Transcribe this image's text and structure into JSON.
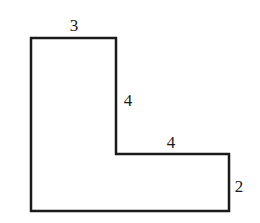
{
  "diagram": {
    "type": "L-shaped polygon",
    "stroke_color": "#1a1a1a",
    "fill_color": "#ffffff",
    "labels": {
      "top": "3",
      "inner_vertical": "4",
      "inner_horizontal": "4",
      "right": "2"
    }
  }
}
